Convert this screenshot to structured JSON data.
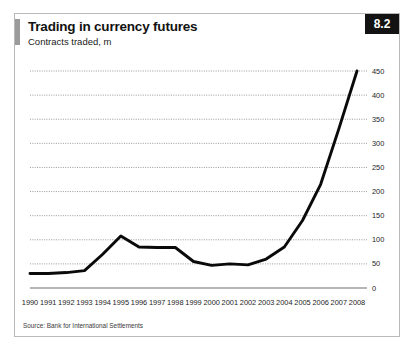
{
  "card": {
    "accent_color": "#9b9b9b",
    "border_color": "#b9b9b9"
  },
  "header": {
    "title": "Trading in currency futures",
    "subtitle": "Contracts traded, m",
    "badge": "8.2",
    "badge_bg": "#131313",
    "badge_fg": "#ffffff"
  },
  "footer": {
    "source": "Source: Bank for International Settlements"
  },
  "chart_data": {
    "type": "line",
    "title": "Trading in currency futures",
    "subtitle": "Contracts traded, m",
    "xlabel": "",
    "ylabel": "Contracts traded, m",
    "ylim": [
      0,
      450
    ],
    "yticks": [
      0,
      50,
      100,
      150,
      200,
      250,
      300,
      350,
      400,
      450
    ],
    "ytick_labels": [
      "0",
      "50",
      "100",
      "150",
      "200",
      "250",
      "300",
      "350",
      "400",
      "450"
    ],
    "y_axis_position": "right",
    "grid": true,
    "grid_style": "dotted-horizontal",
    "legend": "none",
    "line_color": "#0a0a0a",
    "categories": [
      "1990",
      "1991",
      "1992",
      "1993",
      "1994",
      "1995",
      "1996",
      "1997",
      "1998",
      "1999",
      "2000",
      "2001",
      "2002",
      "2003",
      "2004",
      "2005",
      "2006",
      "2007",
      "2008"
    ],
    "series": [
      {
        "name": "Contracts traded",
        "values": [
          30,
          30,
          32,
          36,
          70,
          108,
          85,
          84,
          84,
          55,
          47,
          50,
          48,
          60,
          85,
          140,
          215,
          330,
          450
        ]
      }
    ]
  }
}
